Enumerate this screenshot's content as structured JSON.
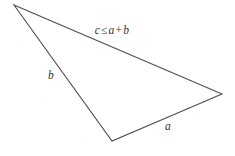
{
  "figure": {
    "kind": "geometry-diagram",
    "background_color": "#ffffff",
    "stroke_color": "#4a4a52",
    "text_color": "#33333a",
    "width": 235,
    "height": 156,
    "vertices": {
      "apex_left": {
        "name": "top-left-vertex",
        "x": 14,
        "y": 5
      },
      "right": {
        "name": "right-vertex",
        "x": 222,
        "y": 94
      },
      "bottom": {
        "name": "bottom-vertex",
        "x": 112,
        "y": 141
      }
    },
    "edges": [
      {
        "name": "edge-c",
        "label_key": "hypotenuse",
        "from": "apex_left",
        "to": "right"
      },
      {
        "name": "edge-a",
        "label_key": "side_a",
        "from": "right",
        "to": "bottom"
      },
      {
        "name": "edge-b",
        "label_key": "side_b",
        "from": "bottom",
        "to": "apex_left"
      }
    ],
    "path_d": "M 14 5 L 222 94 L 112 141 Z"
  },
  "labels": {
    "hypotenuse": {
      "variable_c": "c",
      "relation": "≤",
      "variable_a": "a",
      "plus": "+",
      "variable_b": "b",
      "full_text": "c ≤ a + b",
      "x": 112,
      "y": 31
    },
    "side_b": {
      "text": "b",
      "x": 51,
      "y": 76
    },
    "side_a": {
      "text": "a",
      "x": 168,
      "y": 127
    }
  }
}
